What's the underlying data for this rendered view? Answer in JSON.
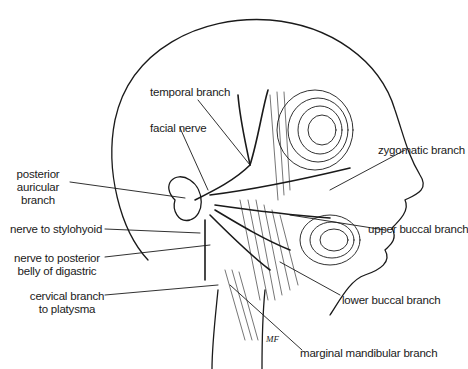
{
  "diagram": {
    "labels": {
      "temporal_branch": "temporal branch",
      "facial_nerve": "facial nerve",
      "zygomatic_branch": "zygomatic branch",
      "posterior_auricular_1": "posterior",
      "posterior_auricular_2": "auricular",
      "posterior_auricular_3": "branch",
      "nerve_to_stylohyoid": "nerve to stylohyoid",
      "upper_buccal_branch": "upper buccal branch",
      "nerve_to_posterior_belly_1": "nerve to posterior",
      "nerve_to_posterior_belly_2": "belly of digastric",
      "cervical_branch_1": "cervical branch",
      "cervical_branch_2": "to platysma",
      "lower_buccal_branch": "lower buccal branch",
      "marginal_mandibular_branch": "marginal mandibular branch"
    },
    "signature": "MF",
    "colors": {
      "line": "#1a1a1a",
      "background": "#ffffff"
    }
  }
}
